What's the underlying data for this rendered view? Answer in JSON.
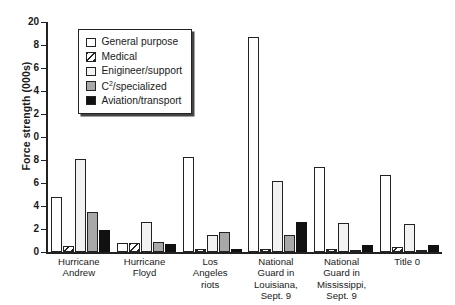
{
  "chart_data": {
    "type": "bar",
    "title": "",
    "xlabel": "",
    "ylabel": "Force strength (000s)",
    "ylim": [
      0,
      20
    ],
    "yticks": [
      0,
      2,
      4,
      6,
      8,
      10,
      12,
      14,
      16,
      18,
      20
    ],
    "ytick_labels": [
      "0",
      "2",
      "4",
      "6",
      "8",
      "0",
      "2",
      "4",
      "6",
      "8",
      "20"
    ],
    "grid": false,
    "legend_position": "upper-left-inset",
    "categories": [
      "Hurricane Andrew",
      "Hurricane Floyd",
      "Los Angeles riots",
      "National Guard in Louisiana, Sept. 9",
      "National Guard in Mississippi, Sept. 9",
      "Title 0"
    ],
    "category_lines": [
      [
        "Hurricane",
        "Andrew"
      ],
      [
        "Hurricane",
        "Floyd"
      ],
      [
        "Los",
        "Angeles",
        "riots"
      ],
      [
        "National",
        "Guard in",
        "Louisiana,",
        "Sept. 9"
      ],
      [
        "National",
        "Guard in",
        "Mississippi,",
        "Sept. 9"
      ],
      [
        "Title 0"
      ]
    ],
    "series": [
      {
        "name": "General purpose",
        "key": "general",
        "fill": "#ffffff",
        "values": [
          4.8,
          0.8,
          8.3,
          18.7,
          7.4,
          6.7
        ]
      },
      {
        "name": "Medical",
        "key": "medical",
        "fill": "hatch",
        "values": [
          0.5,
          0.8,
          0.3,
          0.3,
          0.3,
          0.4
        ]
      },
      {
        "name": "Enigineer/support",
        "key": "engineer",
        "fill": "#f2f2f2",
        "values": [
          8.1,
          2.6,
          1.5,
          6.2,
          2.5,
          2.4
        ]
      },
      {
        "name": "C2/specialized",
        "key": "c2",
        "fill": "#a8a8a8",
        "values": [
          3.5,
          0.9,
          1.7,
          1.5,
          0.1,
          0.1
        ]
      },
      {
        "name": "Aviation/transport",
        "key": "aviation",
        "fill": "#111111",
        "values": [
          1.9,
          0.7,
          0.3,
          2.6,
          0.6,
          0.6
        ]
      }
    ]
  },
  "legend": {
    "items": [
      {
        "label": "General purpose",
        "swatch": "general"
      },
      {
        "label": "Medical",
        "swatch": "medical"
      },
      {
        "label": "Enigineer/support",
        "swatch": "engineer"
      },
      {
        "label": "C2/specialized",
        "swatch": "c2"
      },
      {
        "label": "Aviation/transport",
        "swatch": "aviation"
      }
    ]
  },
  "colors": {
    "axis": "#222222",
    "general": "#ffffff",
    "engineer": "#f2f2f2",
    "c2": "#a8a8a8",
    "aviation": "#111111"
  }
}
